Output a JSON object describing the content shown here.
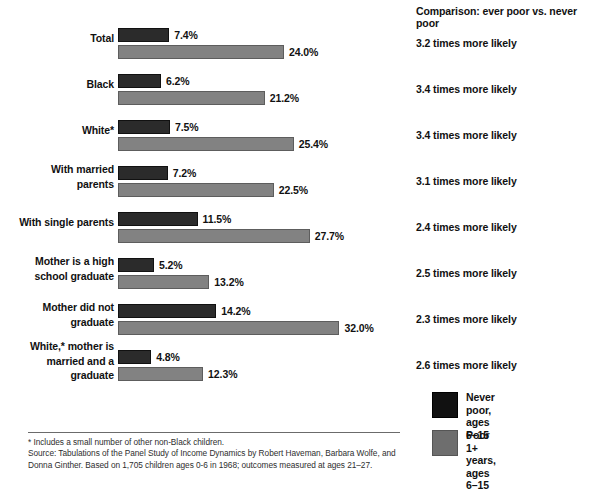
{
  "chart_data": {
    "type": "bar",
    "orientation": "horizontal",
    "title": "",
    "xlabel": "",
    "ylabel": "",
    "xlim": [
      0,
      32
    ],
    "grid": false,
    "legend_position": "bottom-right",
    "categories": [
      "Total",
      "Black",
      "White*",
      "With married\nparents",
      "With single parents",
      "Mother is a high\nschool graduate",
      "Mother did not\ngraduate",
      "White,* mother is\nmarried and a\ngraduate"
    ],
    "series": [
      {
        "name": "Never poor,\nages 6–15",
        "color": "#2b2b2b",
        "values": [
          7.4,
          6.2,
          7.5,
          7.2,
          11.5,
          5.2,
          14.2,
          4.8
        ],
        "value_labels": [
          "7.4%",
          "6.2%",
          "7.5%",
          "7.2%",
          "11.5%",
          "5.2%",
          "14.2%",
          "4.8%"
        ]
      },
      {
        "name": "Poor 1+ years,\nages 6–15",
        "color": "#828282",
        "values": [
          24.0,
          21.2,
          25.4,
          22.5,
          27.7,
          13.2,
          32.0,
          12.3
        ],
        "value_labels": [
          "24.0%",
          "21.2%",
          "25.4%",
          "22.5%",
          "27.7%",
          "13.2%",
          "32.0%",
          "12.3%"
        ]
      }
    ],
    "annotations": {
      "comparison_header": "Comparison: ever poor vs. never poor",
      "comparison_values": [
        "3.2 times more likely",
        "3.4 times more likely",
        "3.4 times more likely",
        "3.1 times more likely",
        "2.4 times more likely",
        "2.5 times more likely",
        "2.3 times more likely",
        "2.6 times more likely"
      ]
    }
  },
  "legend": {
    "items": [
      {
        "label": "Never poor,\nages 6–15",
        "color": "#111111",
        "swatch": "never"
      },
      {
        "label": "Poor 1+ years,\nages 6–15",
        "color": "#6e6e6e",
        "swatch": "poor"
      }
    ]
  },
  "footer": {
    "footnote": "* Includes a small number of other non-Black children.",
    "source": "Source: Tabulations of the Panel Study of Income Dynamics by Robert Haveman, Barbara Wolfe, and Donna Ginther. Based on 1,705 children ages 0-6 in 1968; outcomes measured at ages 21–27."
  },
  "colors": {
    "never_poor": "#2b2b2b",
    "poor_1plus": "#828282",
    "text": "#111111",
    "divider": "#6b6b6b",
    "background": "#ffffff"
  }
}
